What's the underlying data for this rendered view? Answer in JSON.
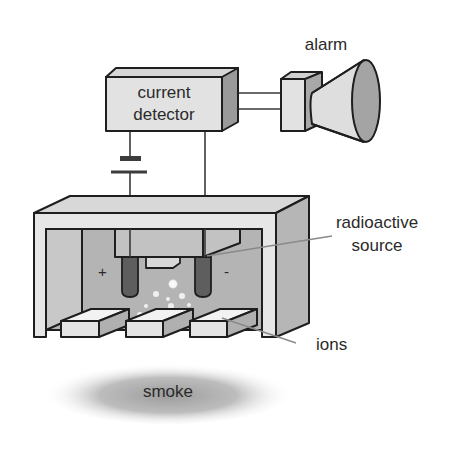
{
  "diagram": {
    "labels": {
      "alarm": "alarm",
      "detector_line1": "current",
      "detector_line2": "detector",
      "source_line1": "radioactive",
      "source_line2": "source",
      "ions": "ions",
      "smoke": "smoke",
      "plus": "+",
      "minus": "-"
    },
    "components": [
      {
        "id": "current-detector",
        "label": "current detector"
      },
      {
        "id": "alarm",
        "label": "alarm"
      },
      {
        "id": "battery",
        "label": ""
      },
      {
        "id": "ionization-chamber",
        "label": ""
      },
      {
        "id": "electrode-positive",
        "label": "+"
      },
      {
        "id": "electrode-negative",
        "label": "-"
      },
      {
        "id": "radioactive-source",
        "label": "radioactive source"
      },
      {
        "id": "ions",
        "label": "ions"
      },
      {
        "id": "smoke",
        "label": "smoke"
      }
    ],
    "colors": {
      "outline": "#1e1e1e",
      "light_face": "#e2e2e2",
      "mid_face": "#c4c4c4",
      "dark_face": "#9a9a9a",
      "electrode": "#5e5e5e",
      "leader_line": "#8a8a8a",
      "text": "#2a2a2a"
    }
  }
}
